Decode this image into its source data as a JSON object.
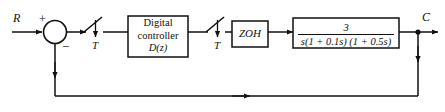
{
  "diagram": {
    "type": "control-system-block-diagram",
    "line_color": "#111111",
    "background_color": "#ffffff",
    "signals": {
      "input_label": "R",
      "output_label": "C",
      "summing_plus": "+",
      "summing_minus": "−"
    },
    "blocks": [
      {
        "id": "digital-controller",
        "line1": "Digital",
        "line2": "controller",
        "line3": "D(z)"
      },
      {
        "id": "zero-order-hold",
        "label": "ZOH"
      },
      {
        "id": "plant",
        "numerator": "3",
        "denominator": "s(1 + 0.1s) (1 + 0.5s)",
        "transfer_function": "3 / [s(1 + 0.1s)(1 + 0.5s)]"
      }
    ],
    "samplers": [
      {
        "id": "sampler-1",
        "period_label": "T"
      },
      {
        "id": "sampler-2",
        "period_label": "T"
      }
    ]
  }
}
